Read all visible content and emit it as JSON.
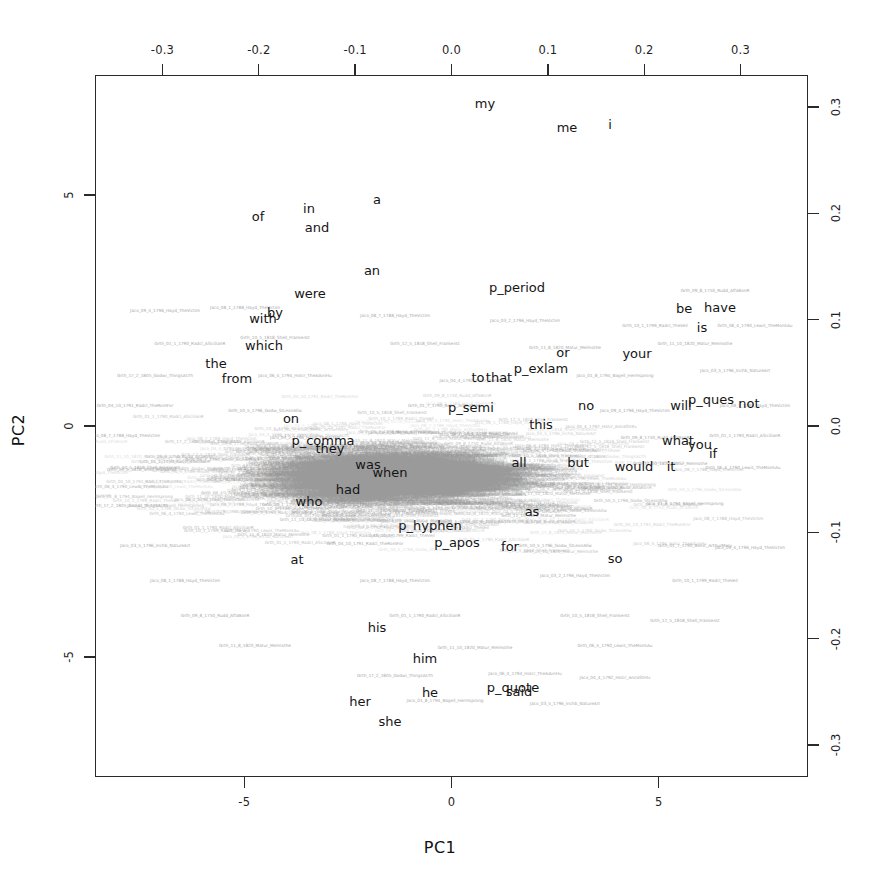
{
  "chart_data": {
    "type": "scatter",
    "title": "",
    "xlabel": "PC1",
    "ylabel": "PC2",
    "bottom_axis": {
      "label": "PC1",
      "ticks": [
        "-5",
        "0",
        "5"
      ],
      "values": [
        -5,
        0,
        5
      ],
      "lim": [
        -8.6,
        8.6
      ]
    },
    "left_axis": {
      "label": "PC2",
      "ticks": [
        "5",
        "0",
        "-5"
      ],
      "values": [
        5,
        0,
        -5
      ],
      "lim": [
        -7.6,
        7.6
      ]
    },
    "top_axis": {
      "ticks": [
        "-0.3",
        "-0.2",
        "-0.1",
        "0.0",
        "0.1",
        "0.2",
        "0.3"
      ],
      "values": [
        -0.3,
        -0.2,
        -0.1,
        0.0,
        0.1,
        0.2,
        0.3
      ],
      "lim": [
        -0.37,
        0.37
      ]
    },
    "right_axis": {
      "ticks": [
        "0.3",
        "0.2",
        "0.1",
        "0.0",
        "-0.1",
        "-0.2",
        "-0.3"
      ],
      "values": [
        0.3,
        0.2,
        0.1,
        0.0,
        -0.1,
        -0.2,
        -0.3
      ],
      "lim": [
        -0.33,
        0.33
      ]
    },
    "grid": false,
    "legend": "none",
    "colors": {
      "word_labels": "#151515",
      "doc_labels": "#9a9a9a",
      "frame": "#2a2a2a"
    },
    "word_loadings": [
      {
        "label": "my",
        "x": 485,
        "y": 103
      },
      {
        "label": "me",
        "x": 567,
        "y": 127
      },
      {
        "label": "i",
        "x": 610,
        "y": 124
      },
      {
        "label": "a",
        "x": 377,
        "y": 199
      },
      {
        "label": "in",
        "x": 309,
        "y": 208
      },
      {
        "label": "of",
        "x": 258,
        "y": 216
      },
      {
        "label": "and",
        "x": 317,
        "y": 227
      },
      {
        "label": "an",
        "x": 372,
        "y": 270
      },
      {
        "label": "p_period",
        "x": 517,
        "y": 287
      },
      {
        "label": "were",
        "x": 310,
        "y": 293
      },
      {
        "label": "be",
        "x": 684,
        "y": 308
      },
      {
        "label": "have",
        "x": 720,
        "y": 307
      },
      {
        "label": "with",
        "x": 263,
        "y": 318
      },
      {
        "label": "by",
        "x": 275,
        "y": 312
      },
      {
        "label": "is",
        "x": 702,
        "y": 327
      },
      {
        "label": "which",
        "x": 264,
        "y": 345
      },
      {
        "label": "or",
        "x": 563,
        "y": 352
      },
      {
        "label": "your",
        "x": 637,
        "y": 353
      },
      {
        "label": "the",
        "x": 216,
        "y": 363
      },
      {
        "label": "from",
        "x": 237,
        "y": 378
      },
      {
        "label": "to",
        "x": 478,
        "y": 377
      },
      {
        "label": "that",
        "x": 499,
        "y": 377
      },
      {
        "label": "p_exlam",
        "x": 541,
        "y": 368
      },
      {
        "label": "p_semi",
        "x": 471,
        "y": 407
      },
      {
        "label": "on",
        "x": 291,
        "y": 418
      },
      {
        "label": "no",
        "x": 586,
        "y": 405
      },
      {
        "label": "will",
        "x": 681,
        "y": 405
      },
      {
        "label": "p_ques",
        "x": 711,
        "y": 399
      },
      {
        "label": "not",
        "x": 749,
        "y": 403
      },
      {
        "label": "this",
        "x": 541,
        "y": 424
      },
      {
        "label": "p_comma",
        "x": 323,
        "y": 440
      },
      {
        "label": "they",
        "x": 330,
        "y": 448
      },
      {
        "label": "what",
        "x": 678,
        "y": 440
      },
      {
        "label": "you",
        "x": 700,
        "y": 444
      },
      {
        "label": "was",
        "x": 368,
        "y": 464
      },
      {
        "label": "when",
        "x": 390,
        "y": 472
      },
      {
        "label": "all",
        "x": 519,
        "y": 462
      },
      {
        "label": "but",
        "x": 578,
        "y": 462
      },
      {
        "label": "if",
        "x": 713,
        "y": 453
      },
      {
        "label": "it",
        "x": 671,
        "y": 466
      },
      {
        "label": "had",
        "x": 348,
        "y": 489
      },
      {
        "label": "who",
        "x": 309,
        "y": 501
      },
      {
        "label": "would",
        "x": 634,
        "y": 466
      },
      {
        "label": "as",
        "x": 532,
        "y": 511
      },
      {
        "label": "p_hyphen",
        "x": 430,
        "y": 525
      },
      {
        "label": "p_apos",
        "x": 457,
        "y": 542
      },
      {
        "label": "for",
        "x": 510,
        "y": 546
      },
      {
        "label": "at",
        "x": 297,
        "y": 559
      },
      {
        "label": "so",
        "x": 615,
        "y": 558
      },
      {
        "label": "his",
        "x": 377,
        "y": 627
      },
      {
        "label": "him",
        "x": 425,
        "y": 658
      },
      {
        "label": "he",
        "x": 430,
        "y": 692
      },
      {
        "label": "p_quote",
        "x": 513,
        "y": 687
      },
      {
        "label": "said",
        "x": 519,
        "y": 691
      },
      {
        "label": "her",
        "x": 360,
        "y": 701
      },
      {
        "label": "she",
        "x": 390,
        "y": 721
      }
    ],
    "doc_label_examples": [
      "Jaco_09_4_1796_Hayd_TheVictim",
      "Jaco_08_1_1788_Hayd_TheVictim",
      "Jaco_08_7_1788_Hayd_TheVictim",
      "Jaco_03_2_1796_Hayd_TheVictim",
      "Grth_10_1_1799_Radcl_TheVeil",
      "Grth_09_8_1750_Rudd_AffaBonR",
      "Grth_01_1_1790_Radcl_ASicilianR",
      "Grth_10_5_1818_Shell_Frankenst",
      "Grth_12_5_1818_Shell_Frankenst",
      "Grth_11_8_1820_Matur_Melmothe",
      "Grth_11_10_1820_Matur_Melmothe",
      "Grth_06_4_1790_Lewis_TheMonkAu",
      "Grth_17_2_1805_Godwi_ThingsAsTh",
      "Jaco_06_4_1794_Holcr_TheAdvnHu",
      "Jaco_04_4_1792_Holcr_AnnaStHIv",
      "Jaco_01_8_1794_Bagell_Hermsprong",
      "Jaco_03_5_1796_Inchb_NatureArt",
      "Grth_04_10_1791_Radcl_TheRomFor",
      "Grth_50_5_1796_Godw_StLeonAllw",
      "Grth_01_7_1790_Benic_ArthurMerv"
    ]
  },
  "axes": {
    "pc1": "PC1",
    "pc2": "PC2",
    "top_ticks": [
      "-0.3",
      "-0.2",
      "-0.1",
      "0.0",
      "0.1",
      "0.2",
      "0.3"
    ],
    "bottom_ticks": [
      "-5",
      "0",
      "5"
    ],
    "left_ticks": [
      "5",
      "0",
      "-5"
    ],
    "right_ticks": [
      "0.3",
      "0.2",
      "0.1",
      "0.0",
      "-0.1",
      "-0.2",
      "-0.3"
    ]
  }
}
